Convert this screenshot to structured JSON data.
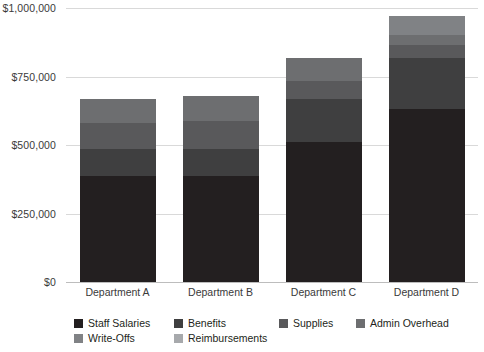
{
  "chart_data": {
    "type": "bar",
    "variant": "stacked-vertical",
    "title": "",
    "subtitle": "",
    "xlabel": "",
    "ylabel": "",
    "grid": true,
    "legend_position": "bottom",
    "categories": [
      "Department A",
      "Department B",
      "Department C",
      "Department D"
    ],
    "ylim": [
      0,
      1000000
    ],
    "ytick_values": [
      0,
      250000,
      500000,
      750000,
      1000000
    ],
    "ytick_labels": [
      "$0",
      "$250,000",
      "$500,000",
      "$750,000",
      "$1,000,000"
    ],
    "series": [
      {
        "name": "Staff Salaries",
        "color": "#231f20",
        "values": [
          388000,
          388000,
          511000,
          630000
        ]
      },
      {
        "name": "Benefits",
        "color": "#3f3f40",
        "values": [
          97000,
          97000,
          157000,
          187000
        ]
      },
      {
        "name": "Supplies",
        "color": "#59595b",
        "values": [
          97000,
          104000,
          67000,
          49000
        ]
      },
      {
        "name": "Admin Overhead",
        "color": "#6d6e70",
        "values": [
          86000,
          90000,
          82000,
          37000
        ]
      },
      {
        "name": "Write-Offs",
        "color": "#808285",
        "values": [
          0,
          0,
          0,
          67000
        ]
      },
      {
        "name": "Reimbursements",
        "color": "#a7a9ac",
        "values": [
          0,
          0,
          0,
          0
        ]
      }
    ],
    "totals": [
      668000,
      679000,
      817000,
      970000
    ],
    "annotations": []
  },
  "axes": {
    "y_axis_name": "y-axis",
    "x_axis_name": "x-axis"
  },
  "colors": {
    "background": "#ffffff",
    "gridline": "#d9d9d9",
    "baseline": "#bdbdbd",
    "text": "#231f20"
  }
}
